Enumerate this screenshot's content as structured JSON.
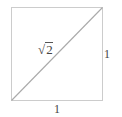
{
  "figure": {
    "type": "square-with-diagonal",
    "colors": {
      "background": "#ffffff",
      "square_stroke": "#cccccc",
      "diagonal_stroke": "#aaaaaa",
      "label_text": "#444444"
    },
    "square": {
      "x": 11,
      "y": 7,
      "width": 91,
      "height": 93
    },
    "diagonal": {
      "x1": 11,
      "y1": 100,
      "x2": 102,
      "y2": 7
    },
    "labels": {
      "diagonal": {
        "radical": "√",
        "radicand": "2"
      },
      "right_side": "1",
      "bottom_side": "1"
    }
  }
}
